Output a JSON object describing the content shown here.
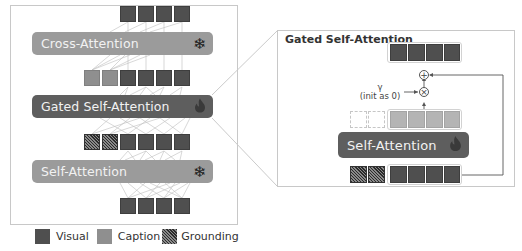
{
  "left_panel": {
    "layers": [
      {
        "label": "Cross-Attention",
        "state": "frozen",
        "icon": "snowflake-icon"
      },
      {
        "label": "Gated Self-Attention",
        "state": "trained",
        "icon": "fire-icon"
      },
      {
        "label": "Self-Attention",
        "state": "frozen",
        "icon": "snowflake-icon"
      }
    ],
    "token_rows": [
      {
        "row": "top",
        "tokens": [
          "visual",
          "visual",
          "visual",
          "visual"
        ]
      },
      {
        "row": "after-gated-input",
        "tokens": [
          "caption",
          "caption",
          "visual",
          "visual",
          "visual",
          "visual"
        ]
      },
      {
        "row": "after-self-attn",
        "tokens": [
          "grounding",
          "grounding",
          "visual",
          "visual",
          "visual",
          "visual"
        ]
      },
      {
        "row": "bottom",
        "tokens": [
          "visual",
          "visual",
          "visual",
          "visual"
        ]
      }
    ]
  },
  "right_panel": {
    "title": "Gated Self-Attention",
    "inner_layer": {
      "label": "Self-Attention",
      "state": "trained",
      "icon": "fire-icon"
    },
    "gate": {
      "symbol": "γ",
      "note": "(init as 0)"
    },
    "ops": {
      "add": "⊕",
      "multiply": "⊗"
    }
  },
  "icons": {
    "snowflake": "❄",
    "fire": "🔥"
  },
  "legend": [
    {
      "label": "Visual",
      "kind": "visual"
    },
    {
      "label": "Caption",
      "kind": "caption"
    },
    {
      "label": "Grounding",
      "kind": "grounding"
    }
  ],
  "colors": {
    "visual": "#4f4f4f",
    "caption": "#8f8f8f",
    "frozen_bar": "#9b9b9b",
    "trained_bar": "#5e5e5e"
  }
}
